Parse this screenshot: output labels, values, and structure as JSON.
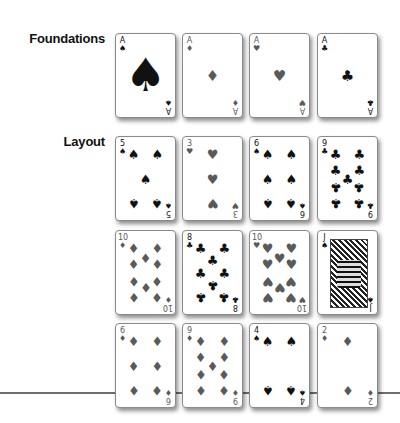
{
  "labels": {
    "foundations": "Foundations",
    "layout": "Layout"
  },
  "colors": {
    "black_suit": "#111111",
    "red_suit": "#5a5a5a",
    "divider": "#6e6e6e"
  },
  "suits": {
    "spades": "♠",
    "hearts": "♥",
    "diamonds": "♦",
    "clubs": "♣"
  },
  "foundations": [
    {
      "rank": "A",
      "suit": "spades",
      "suit_char": "♠",
      "color": "black"
    },
    {
      "rank": "A",
      "suit": "diamonds",
      "suit_char": "♦",
      "color": "red"
    },
    {
      "rank": "A",
      "suit": "hearts",
      "suit_char": "♥",
      "color": "red"
    },
    {
      "rank": "A",
      "suit": "clubs",
      "suit_char": "♣",
      "color": "black"
    }
  ],
  "layout": [
    [
      {
        "rank": "5",
        "suit": "spades",
        "suit_char": "♠",
        "color": "black"
      },
      {
        "rank": "3",
        "suit": "hearts",
        "suit_char": "♥",
        "color": "red"
      },
      {
        "rank": "6",
        "suit": "spades",
        "suit_char": "♠",
        "color": "black"
      },
      {
        "rank": "9",
        "suit": "clubs",
        "suit_char": "♣",
        "color": "black"
      }
    ],
    [
      {
        "rank": "10",
        "suit": "diamonds",
        "suit_char": "♦",
        "color": "red"
      },
      {
        "rank": "8",
        "suit": "clubs",
        "suit_char": "♣",
        "color": "black"
      },
      {
        "rank": "10",
        "suit": "hearts",
        "suit_char": "♥",
        "color": "red"
      },
      {
        "rank": "J",
        "suit": "spades",
        "suit_char": "♠",
        "color": "black"
      }
    ],
    [
      {
        "rank": "6",
        "suit": "diamonds",
        "suit_char": "♦",
        "color": "red"
      },
      {
        "rank": "9",
        "suit": "diamonds",
        "suit_char": "♦",
        "color": "red"
      },
      {
        "rank": "4",
        "suit": "spades",
        "suit_char": "♠",
        "color": "black"
      },
      {
        "rank": "2",
        "suit": "diamonds",
        "suit_char": "♦",
        "color": "red"
      }
    ]
  ]
}
